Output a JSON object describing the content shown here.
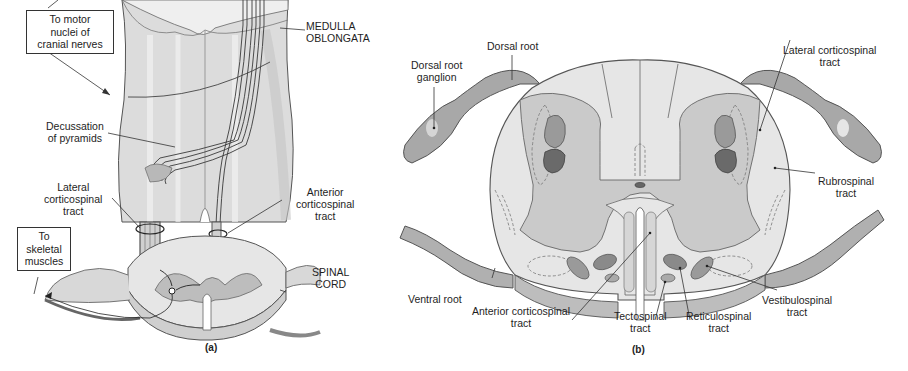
{
  "figure": {
    "panel_a": {
      "caption": "(a)",
      "boxes": {
        "motor_nuclei": [
          "To motor",
          "nuclei of",
          "cranial nerves"
        ],
        "skeletal_muscles": [
          "To",
          "skeletal",
          "muscles"
        ]
      },
      "labels": {
        "medulla": [
          "MEDULLA",
          "OBLONGATA"
        ],
        "decussation": [
          "Decussation",
          "of pyramids"
        ],
        "lateral_cst": [
          "Lateral",
          "corticospinal",
          "tract"
        ],
        "anterior_cst": [
          "Anterior",
          "corticospinal",
          "tract"
        ],
        "spinal_cord": [
          "SPINAL",
          "CORD"
        ]
      }
    },
    "panel_b": {
      "caption": "(b)",
      "labels": {
        "dorsal_root": [
          "Dorsal root"
        ],
        "dorsal_root_ganglion": [
          "Dorsal root",
          "ganglion"
        ],
        "lateral_cst": [
          "Lateral corticospinal",
          "tract"
        ],
        "rubrospinal": [
          "Rubrospinal",
          "tract"
        ],
        "ventral_root": [
          "Ventral root"
        ],
        "anterior_cst": [
          "Anterior corticospinal",
          "tract"
        ],
        "tectospinal": [
          "Tectospinal",
          "tract"
        ],
        "reticulospinal": [
          "Reticulospinal",
          "tract"
        ],
        "vestibulospinal": [
          "Vestibulospinal",
          "tract"
        ]
      }
    },
    "colors": {
      "white_matter": "#e4e4e4",
      "gray_matter": "#c8c8c8",
      "tract_medium": "#9a9a9a",
      "tract_dark": "#6a6a6a",
      "root": "#a8a8a8",
      "outline": "#555555"
    }
  }
}
